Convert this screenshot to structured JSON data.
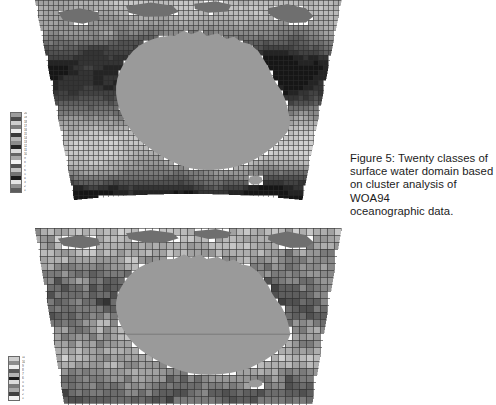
{
  "page": {
    "background_color": "#ffffff",
    "width": 496,
    "height": 405
  },
  "caption": {
    "text": "Figure 5: Twenty classes of\nsurface water domain based\non cluster analysis of WOA94\noceanographic data.",
    "color": "#1b1b1b",
    "x": 350,
    "y": 152
  },
  "maps": [
    {
      "id": "top-map",
      "name": "surface-water-domain-map-upper",
      "x": 33,
      "y": 0,
      "width": 310,
      "height": 205,
      "projection": "conic",
      "landmass_color": "#9a9a9a",
      "ocean_grid": true,
      "grid_line_color": "#2b2b2b",
      "cell_size": 5,
      "description": "Gridded greyscale cluster classes of surface water domain around Australia, finer cell structure"
    },
    {
      "id": "bottom-map",
      "name": "surface-water-domain-map-lower",
      "x": 33,
      "y": 228,
      "width": 310,
      "height": 177,
      "projection": "conic",
      "landmass_color": "#9a9a9a",
      "ocean_grid": true,
      "grid_line_color": "#2b2b2b",
      "cell_size": 7,
      "description": "Gridded greyscale cluster classes of surface water domain around Australia, coarser speckled cell structure"
    }
  ],
  "legends": [
    {
      "id": "top-legend",
      "name": "class-legend-upper",
      "x": 10,
      "y": 112,
      "bar_width": 12,
      "bar_height": 81,
      "class_count": 20,
      "swatch_colors": [
        "#9c9c9c",
        "#4b4b4b",
        "#cfcfcf",
        "#7e7e7e",
        "#ededed",
        "#3a3a3a",
        "#b5b5b5",
        "#8c8c8c",
        "#262626",
        "#dcdcdc",
        "#646464",
        "#a8a8a8",
        "#f2f2f2",
        "#515151",
        "#c2c2c2",
        "#747474",
        "#1c1c1c",
        "#e4e4e4",
        "#8f8f8f",
        "#5c5c5c"
      ],
      "tick_labels": [
        "20",
        "19",
        "18",
        "17",
        "16",
        "15",
        "14",
        "13",
        "12",
        "11",
        "10",
        "9",
        "8",
        "7",
        "6",
        "5",
        "4",
        "3",
        "2",
        "1"
      ]
    },
    {
      "id": "bottom-legend",
      "name": "class-legend-lower",
      "x": 8,
      "y": 356,
      "bar_width": 12,
      "bar_height": 45,
      "class_count": 11,
      "swatch_colors": [
        "#cfcfcf",
        "#8c8c8c",
        "#ededed",
        "#5a5a5a",
        "#b5b5b5",
        "#1c1c1c",
        "#dcdcdc",
        "#7a7a7a",
        "#a8a8a8",
        "#3f3f3f",
        "#f0f0f0"
      ],
      "tick_labels": [
        "11",
        "10",
        "9",
        "8",
        "7",
        "6",
        "5",
        "4",
        "3",
        "2",
        "1"
      ]
    }
  ]
}
